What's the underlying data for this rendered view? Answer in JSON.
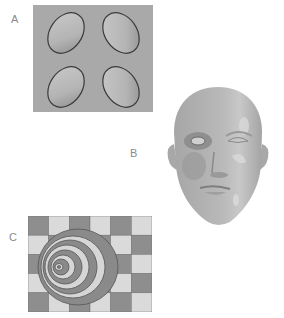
{
  "figure": {
    "panels": [
      {
        "label": "A",
        "description": "Gray plane with four oval depressions"
      },
      {
        "label": "B",
        "description": "Shaded 3D rendering of a human head"
      },
      {
        "label": "C",
        "description": "Nested ellipses over a checkerboard"
      }
    ],
    "panel_c": {
      "columns": 6,
      "rows": 5
    },
    "colors": {
      "plane": "#a9a9a9",
      "oval_fill": "#b8b8b8",
      "oval_rim": "#3a3a3a",
      "head": "#b5b5b5",
      "check_dark": "#8e8e8e",
      "check_light": "#dadada",
      "ring_dark": "#8a8a8a",
      "ring_light": "#d6d6d6",
      "label": "#8a8a8a"
    }
  }
}
